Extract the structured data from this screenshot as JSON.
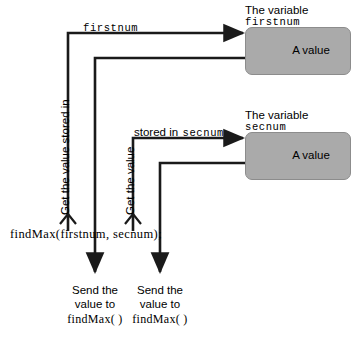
{
  "diagram": {
    "colors": {
      "line": "#1a1a1a",
      "box_fill": "#aaaaaa",
      "box_border": "#8c8c8c",
      "text": "#000000",
      "background": "#ffffff"
    },
    "code_statement": "findMax(firstnum, secnum);",
    "boxes": [
      {
        "caption_line1": "The variable",
        "caption_line2": "firstnum",
        "value_label": "A value"
      },
      {
        "caption_line1": "The variable",
        "caption_line2": "secnum",
        "value_label": "A value"
      }
    ],
    "wire_labels": [
      {
        "sans": "",
        "mono": "firstnum"
      },
      {
        "sans": "stored in",
        "mono": "secnum"
      }
    ],
    "vertical_labels": [
      "Get the value stored in",
      "Get the value"
    ],
    "bottom_captions": [
      {
        "line1": "Send the",
        "line2": "value to",
        "line3": "findMax( )"
      },
      {
        "line1": "Send the",
        "line2": "value to",
        "line3": "findMax( )"
      }
    ]
  }
}
